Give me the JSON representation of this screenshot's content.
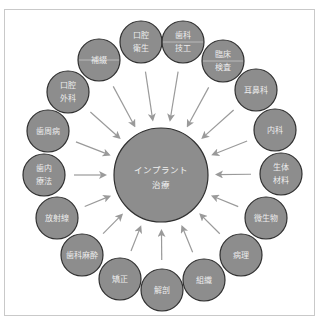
{
  "diagram": {
    "type": "radial-hub",
    "colors": {
      "node_fill": "#8d8d8d",
      "node_stroke": "#2f2f2f",
      "arrow": "#9a9a9a",
      "label": "#ececec",
      "frame": "#c9c9c9"
    },
    "center": {
      "lines": [
        "インプラント",
        "治療"
      ],
      "cx": 161,
      "cy": 175,
      "r": 47
    },
    "nodes": [
      {
        "id": "hotetsu",
        "lines": [
          "補綴"
        ],
        "cx": 99,
        "cy": 60,
        "divider": true
      },
      {
        "id": "koku-eisei",
        "lines": [
          "口腔",
          "衛生"
        ],
        "cx": 141,
        "cy": 42,
        "divider": false
      },
      {
        "id": "shika-giko",
        "lines": [
          "歯科",
          "技工"
        ],
        "cx": 183,
        "cy": 42,
        "divider": true
      },
      {
        "id": "rinsho-kensa",
        "lines": [
          "臨床",
          "検査"
        ],
        "cx": 223,
        "cy": 61,
        "divider": true
      },
      {
        "id": "jibika",
        "lines": [
          "耳鼻科"
        ],
        "cx": 256,
        "cy": 90,
        "divider": false
      },
      {
        "id": "naika",
        "lines": [
          "内科"
        ],
        "cx": 275,
        "cy": 130,
        "divider": false
      },
      {
        "id": "seitai-zairyo",
        "lines": [
          "生体",
          "材料"
        ],
        "cx": 281,
        "cy": 174,
        "divider": false
      },
      {
        "id": "biseibutsu",
        "lines": [
          "微生物"
        ],
        "cx": 266,
        "cy": 218,
        "divider": false
      },
      {
        "id": "byori",
        "lines": [
          "病理"
        ],
        "cx": 241,
        "cy": 255,
        "divider": false
      },
      {
        "id": "soshiki",
        "lines": [
          "組織"
        ],
        "cx": 204,
        "cy": 280,
        "divider": false
      },
      {
        "id": "kaibo",
        "lines": [
          "解剖"
        ],
        "cx": 162,
        "cy": 290,
        "divider": false
      },
      {
        "id": "kyosei",
        "lines": [
          "矯正"
        ],
        "cx": 120,
        "cy": 279,
        "divider": false
      },
      {
        "id": "shika-masui",
        "lines": [
          "歯科麻酔"
        ],
        "cx": 82,
        "cy": 255,
        "divider": false
      },
      {
        "id": "hoshasen",
        "lines": [
          "放射線"
        ],
        "cx": 57,
        "cy": 218,
        "divider": false
      },
      {
        "id": "shinai-ryoho",
        "lines": [
          "歯内",
          "療法"
        ],
        "cx": 44,
        "cy": 175,
        "divider": false
      },
      {
        "id": "shishubyo",
        "lines": [
          "歯周病"
        ],
        "cx": 48,
        "cy": 131,
        "divider": false
      },
      {
        "id": "koku-geka",
        "lines": [
          "口腔",
          "外科"
        ],
        "cx": 68,
        "cy": 92,
        "divider": false
      }
    ],
    "node_radius": 21
  }
}
